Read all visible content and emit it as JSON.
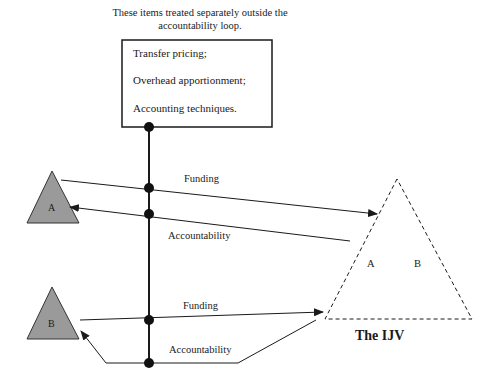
{
  "note": {
    "line1": "These items treated separately outside the",
    "line2": "accountability loop."
  },
  "box": {
    "items": [
      "Transfer pricing;",
      "Overhead apportionment;",
      "Accounting techniques."
    ]
  },
  "parties": {
    "a": {
      "label": "A",
      "fill": "#9a9a9a"
    },
    "b": {
      "label": "B",
      "fill": "#9a9a9a"
    }
  },
  "ijv": {
    "title": "The IJV",
    "inner_labels": [
      "A",
      "B"
    ],
    "border_style": "dashed"
  },
  "flows": [
    {
      "from": "A",
      "to": "IJV",
      "label": "Funding"
    },
    {
      "from": "IJV",
      "to": "A",
      "label": "Accountability"
    },
    {
      "from": "B",
      "to": "IJV",
      "label": "Funding"
    },
    {
      "from": "IJV",
      "to": "B",
      "label": "Accountability"
    }
  ]
}
